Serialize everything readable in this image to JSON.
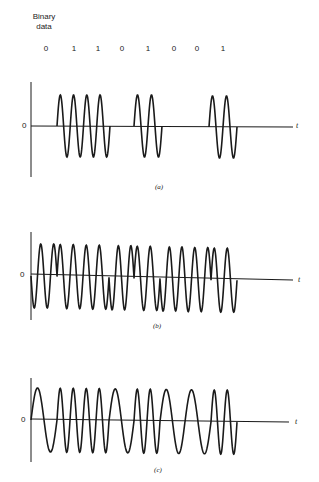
{
  "header": {
    "title_line1": "Binary",
    "title_line2": "data"
  },
  "bits": [
    "0",
    "1",
    "1",
    "0",
    "1",
    "0",
    "0",
    "1"
  ],
  "panels": [
    {
      "id": "a",
      "caption": "(a)",
      "zero_label": "0",
      "axis_label": "t",
      "modulation": "amplitude-shift keying (on-off)"
    },
    {
      "id": "b",
      "caption": "(b)",
      "zero_label": "0",
      "axis_label": "t",
      "modulation": "phase-shift keying"
    },
    {
      "id": "c",
      "caption": "(c)",
      "zero_label": "0",
      "axis_label": "t",
      "modulation": "frequency-shift keying"
    }
  ],
  "colors": {
    "stroke": "#1a1a1a",
    "background": "#ffffff"
  }
}
